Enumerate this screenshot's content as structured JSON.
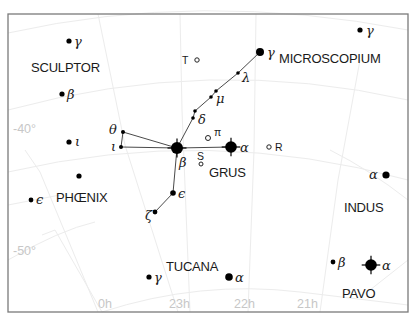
{
  "chart_data": {
    "type": "star_chart",
    "frame": {
      "x": 8,
      "y": 14,
      "width": 400,
      "height": 298
    },
    "axes": {
      "declination_labels": [
        {
          "text": "-40°",
          "x": 13,
          "y": 133
        },
        {
          "text": "-50°",
          "x": 13,
          "y": 255
        }
      ],
      "right_ascension_labels": [
        {
          "text": "0h",
          "x": 98,
          "y": 308
        },
        {
          "text": "23h",
          "x": 169,
          "y": 308
        },
        {
          "text": "22h",
          "x": 234,
          "y": 308
        },
        {
          "text": "21h",
          "x": 297,
          "y": 308
        }
      ]
    },
    "constellations": [
      {
        "name": "SCULPTOR",
        "x": 31,
        "y": 72
      },
      {
        "name": "MICROSCOPIUM",
        "x": 279,
        "y": 63
      },
      {
        "name": "PHŒNIX",
        "x": 56,
        "y": 202
      },
      {
        "name": "GRUS",
        "x": 209,
        "y": 177
      },
      {
        "name": "INDUS",
        "x": 344,
        "y": 212
      },
      {
        "name": "TUCANA",
        "x": 166,
        "y": 271
      },
      {
        "name": "PAVO",
        "x": 342,
        "y": 298
      }
    ],
    "stars": [
      {
        "id": "scl-gamma",
        "x": 69,
        "y": 41,
        "r": 2.6,
        "label": "γ",
        "lx": 74,
        "ly": 46
      },
      {
        "id": "scl-beta",
        "x": 62,
        "y": 94,
        "r": 2.6,
        "label": "β",
        "lx": 67,
        "ly": 99
      },
      {
        "id": "phe-iota",
        "x": 69,
        "y": 142,
        "r": 2.6,
        "label": "ι",
        "lx": 75,
        "ly": 146
      },
      {
        "id": "phe-unlabeled",
        "x": 79,
        "y": 176,
        "r": 2.6,
        "label": "",
        "lx": 0,
        "ly": 0
      },
      {
        "id": "phe-epsilon",
        "x": 31,
        "y": 200,
        "r": 2.4,
        "label": "ϵ",
        "lx": 36,
        "ly": 204
      },
      {
        "id": "gru-theta",
        "x": 123,
        "y": 132,
        "r": 2.0,
        "label": "θ",
        "lx": 109,
        "ly": 134
      },
      {
        "id": "gru-iota",
        "x": 121,
        "y": 147,
        "r": 2.0,
        "label": "ι",
        "lx": 111,
        "ly": 151
      },
      {
        "id": "gru-beta",
        "x": 177,
        "y": 148,
        "r": 6.0,
        "label": "β",
        "lx": 179,
        "ly": 167,
        "spikes": true
      },
      {
        "id": "gru-alpha",
        "x": 231,
        "y": 147,
        "r": 5.8,
        "label": "α",
        "lx": 240,
        "ly": 152,
        "spikes": true
      },
      {
        "id": "gru-delta1",
        "x": 195,
        "y": 111,
        "r": 1.8,
        "label": "",
        "lx": 0,
        "ly": 0
      },
      {
        "id": "gru-delta2",
        "x": 193,
        "y": 118,
        "r": 1.8,
        "label": "δ",
        "lx": 198,
        "ly": 124
      },
      {
        "id": "gru-mu1",
        "x": 216,
        "y": 91,
        "r": 1.8,
        "label": "",
        "lx": 0,
        "ly": 0
      },
      {
        "id": "gru-mu2",
        "x": 211,
        "y": 97,
        "r": 1.8,
        "label": "μ",
        "lx": 216,
        "ly": 103
      },
      {
        "id": "gru-lambda",
        "x": 238,
        "y": 73,
        "r": 1.8,
        "label": "λ",
        "lx": 242,
        "ly": 82
      },
      {
        "id": "gru-gamma",
        "x": 260,
        "y": 52,
        "r": 4.0,
        "label": "γ",
        "lx": 267,
        "ly": 57
      },
      {
        "id": "gru-epsilon",
        "x": 173,
        "y": 193,
        "r": 2.8,
        "label": "ϵ",
        "lx": 178,
        "ly": 198
      },
      {
        "id": "gru-zeta",
        "x": 155,
        "y": 212,
        "r": 2.4,
        "label": "ζ",
        "lx": 145,
        "ly": 220
      },
      {
        "id": "mic-gamma",
        "x": 360,
        "y": 30,
        "r": 2.6,
        "label": "γ",
        "lx": 366,
        "ly": 35
      },
      {
        "id": "ind-alpha",
        "x": 386,
        "y": 175,
        "r": 3.6,
        "label": "α",
        "lx": 369,
        "ly": 179
      },
      {
        "id": "tuc-gamma",
        "x": 149,
        "y": 277,
        "r": 2.6,
        "label": "γ",
        "lx": 154,
        "ly": 282
      },
      {
        "id": "tuc-alpha",
        "x": 229,
        "y": 277,
        "r": 3.8,
        "label": "α",
        "lx": 235,
        "ly": 282
      },
      {
        "id": "pav-beta",
        "x": 333,
        "y": 262,
        "r": 2.4,
        "label": "β",
        "lx": 338,
        "ly": 267
      },
      {
        "id": "pav-alpha",
        "x": 371,
        "y": 265,
        "r": 5.8,
        "label": "α",
        "lx": 382,
        "ly": 270,
        "spikes": true
      }
    ],
    "variable_stars": [
      {
        "id": "var-T",
        "label": "T",
        "x": 197,
        "y": 60,
        "r": 2.2,
        "lx": 182,
        "ly": 64
      },
      {
        "id": "var-pi",
        "label": "π",
        "x": 208,
        "y": 138,
        "r": 2.5,
        "lx": 214,
        "ly": 136
      },
      {
        "id": "var-S",
        "label": "S",
        "x": 201,
        "y": 164,
        "r": 2.0,
        "lx": 197,
        "ly": 160
      },
      {
        "id": "var-R",
        "label": "R",
        "x": 269,
        "y": 147,
        "r": 2.2,
        "lx": 275,
        "ly": 151
      }
    ],
    "lines": [
      {
        "from": "gru-beta",
        "to": "gru-alpha"
      },
      {
        "from": "gru-beta",
        "to": "gru-iota"
      },
      {
        "from": "gru-beta",
        "to": "gru-theta"
      },
      {
        "from": "gru-theta",
        "to": "gru-iota"
      },
      {
        "from": "gru-beta",
        "to": "gru-delta2"
      },
      {
        "from": "gru-delta2",
        "to": "gru-delta1"
      },
      {
        "from": "gru-delta1",
        "to": "gru-mu2"
      },
      {
        "from": "gru-mu2",
        "to": "gru-mu1"
      },
      {
        "from": "gru-mu1",
        "to": "gru-lambda"
      },
      {
        "from": "gru-lambda",
        "to": "gru-gamma"
      },
      {
        "from": "gru-beta",
        "to": "gru-epsilon"
      },
      {
        "from": "gru-epsilon",
        "to": "gru-zeta"
      }
    ],
    "grid_lines": [
      "M8,33 Q200,-10 408,30",
      "M8,110 Q210,55 408,100",
      "M8,172 Q210,125 408,180",
      "M25,150 L40,172 L98,312",
      "M42,235 L55,230 L102,312",
      "M8,260 Q60,230 95,222",
      "M102,312 Q200,280 300,292 L408,305",
      "M98,14 L125,145 L178,312",
      "M180,14 L182,110 L190,312",
      "M256,14 L254,150 L248,312",
      "M360,60 L338,180 L320,312",
      "M8,205 L60,195",
      "M330,150 Q370,170 408,200",
      "M370,290 L408,260"
    ]
  }
}
